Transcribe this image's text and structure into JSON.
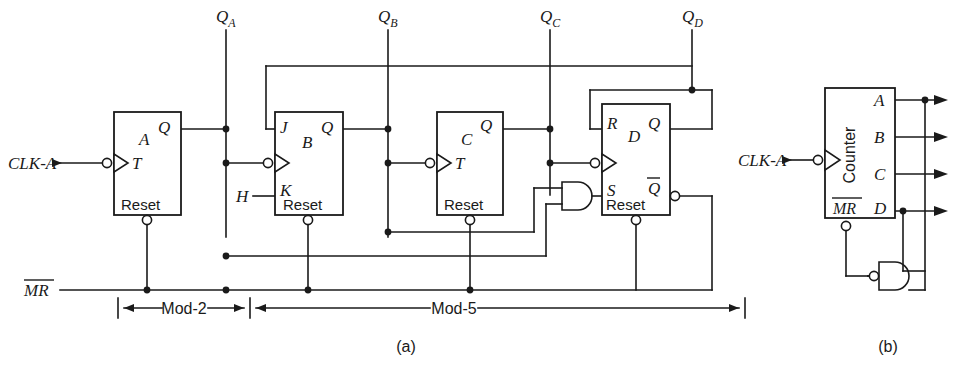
{
  "figure": {
    "caption_a": "(a)",
    "caption_b": "(b)"
  },
  "signals": {
    "clk_a_left": "CLK-A",
    "clk_a_right": "CLK-A",
    "mr": "MR",
    "mr_overbar": true,
    "h": "H",
    "qa": "Q",
    "qa_sub": "A",
    "qb": "Q",
    "qb_sub": "B",
    "qc": "Q",
    "qc_sub": "C",
    "qd": "Q",
    "qd_sub": "D"
  },
  "flipflops": [
    {
      "id": "ff-a",
      "name": "A",
      "inputs": [
        "T"
      ],
      "outputs": [
        "Q"
      ],
      "reset_label": "Reset",
      "x": 114,
      "y": 112,
      "w": 67,
      "h": 103
    },
    {
      "id": "ff-b",
      "name": "B",
      "inputs": [
        "J",
        "K"
      ],
      "outputs": [
        "Q"
      ],
      "reset_label": "Reset",
      "x": 275,
      "y": 112,
      "w": 68,
      "h": 103
    },
    {
      "id": "ff-c",
      "name": "C",
      "inputs": [
        "T"
      ],
      "outputs": [
        "Q"
      ],
      "reset_label": "Reset",
      "x": 437,
      "y": 112,
      "w": 66,
      "h": 103
    },
    {
      "id": "ff-d",
      "name": "D",
      "inputs": [
        "R",
        "S"
      ],
      "outputs": [
        "Q",
        "Qbar"
      ],
      "reset_label": "Reset",
      "x": 602,
      "y": 104,
      "w": 68,
      "h": 111
    }
  ],
  "gates": {
    "and_gate_a": {
      "type": "AND",
      "label": ""
    },
    "nand_gate_b": {
      "type": "NAND",
      "label": ""
    }
  },
  "counter_block": {
    "title": "Counter",
    "mr_label": "MR",
    "outputs": [
      "A",
      "B",
      "C",
      "D"
    ],
    "x": 825,
    "y": 88,
    "w": 70,
    "h": 130
  },
  "dimensions": [
    {
      "label": "Mod-2",
      "from_x": 118,
      "to_x": 249,
      "y": 306
    },
    {
      "label": "Mod-5",
      "from_x": 252,
      "to_x": 745,
      "y": 306
    }
  ],
  "colors": {
    "ink": "#1a1a1a",
    "background": "#ffffff"
  }
}
